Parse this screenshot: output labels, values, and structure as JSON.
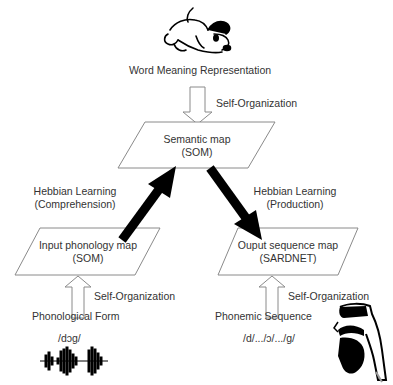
{
  "top": {
    "image_icon": "dog-cartoon",
    "caption": "Word Meaning Representation",
    "arrow_label": "Self-Organization"
  },
  "semantic_map": {
    "line1": "Semantic map",
    "line2": "(SOM)"
  },
  "hebbian_left": {
    "line1": "Hebbian Learning",
    "line2": "(Comprehension)"
  },
  "hebbian_right": {
    "line1": "Hebbian Learning",
    "line2": "(Production)"
  },
  "input_map": {
    "line1": "Input phonology map",
    "line2": "(SOM)",
    "arrow_label": "Self-Organization",
    "source_label": "Phonological Form",
    "transcription": "/dɔg/",
    "image_icon": "waveform"
  },
  "output_map": {
    "line1": "Ouput sequence map",
    "line2": "(SARDNET)",
    "arrow_label": "Self-Organization",
    "source_label": "Phonemic Sequence",
    "transcription": "/d/.../ɔ/.../g/",
    "image_icon": "vocal-tract-head"
  },
  "colors": {
    "line": "#8a8a8a",
    "bold_arrow": "#000000",
    "text": "#333333"
  }
}
